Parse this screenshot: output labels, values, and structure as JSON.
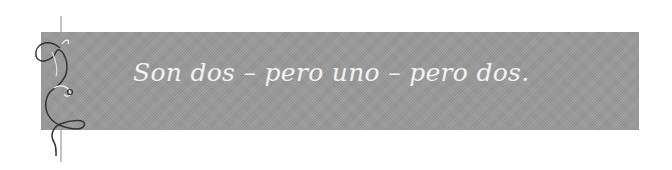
{
  "banner": {
    "caption": "Son dos – pero uno – pero dos.",
    "background_color": "#9a9a9a",
    "text_color": "#f2f2f2"
  },
  "ornament": {
    "icon": "vine-flourish-icon"
  }
}
